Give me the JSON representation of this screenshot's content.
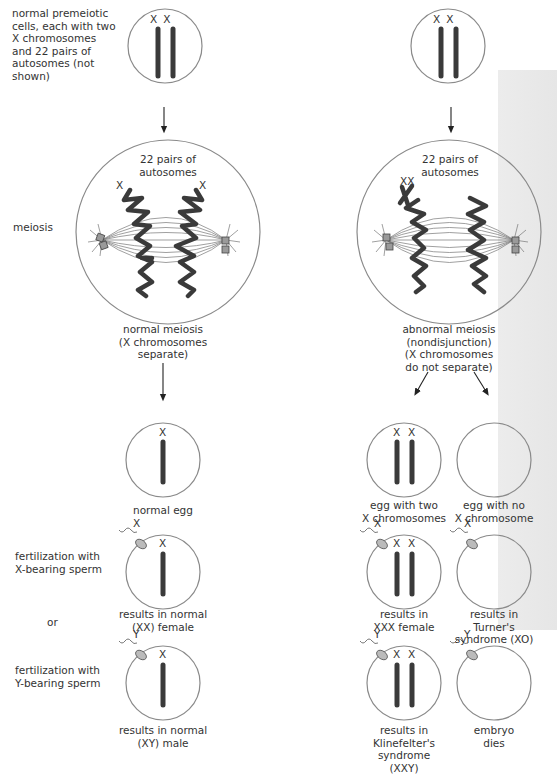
{
  "left_labels": {
    "premeiotic": [
      "normal premeiotic",
      "cells, each with two",
      "X chromosomes",
      "and 22 pairs of",
      "autosomes (not",
      "shown)"
    ],
    "meiosis": "meiosis",
    "fert_x": [
      "fertilization with",
      "X-bearing sperm"
    ],
    "or": "or",
    "fert_y": [
      "fertilization with",
      "Y-bearing sperm"
    ]
  },
  "cells": {
    "premeiotic_left": {
      "chrom_labels": [
        "X",
        "X"
      ]
    },
    "premeiotic_right": {
      "chrom_labels": [
        "X",
        "X"
      ]
    },
    "meiosis_left": {
      "title": [
        "22 pairs of",
        "autosomes"
      ],
      "x_labels": [
        "X",
        "X"
      ]
    },
    "meiosis_right": {
      "title": [
        "22 pairs of",
        "autosomes"
      ],
      "x_labels": [
        "XX"
      ]
    }
  },
  "captions": {
    "normal_meiosis": [
      "normal meiosis",
      "(X chromosomes",
      "separate)"
    ],
    "abnormal_meiosis": [
      "abnormal meiosis",
      "(nondisjunction)",
      "(X chromosomes",
      "do not separate)"
    ],
    "normal_egg": "normal egg",
    "egg_two_x": [
      "egg with two",
      "X chromosomes"
    ],
    "egg_no_x": [
      "egg with no",
      "X chromosome"
    ],
    "normal_female": [
      "results in normal",
      "(XX) female"
    ],
    "xxx_female": [
      "results in",
      "XXX female"
    ],
    "turner": [
      "results in",
      "Turner's",
      "syndrome (XO)"
    ],
    "normal_male": [
      "results in normal",
      "(XY) male"
    ],
    "klinefelter": [
      "results in",
      "Klinefelter's",
      "syndrome",
      "(XXY)"
    ],
    "embryo_dies": [
      "embryo",
      "dies"
    ]
  },
  "glyphs": {
    "x": "X",
    "y": "Y"
  },
  "colors": {
    "outline": "#8a8a8a",
    "chromosome": "#3a3a3a",
    "centriole": "#9a9a9a",
    "band": "#e8e8e8"
  }
}
